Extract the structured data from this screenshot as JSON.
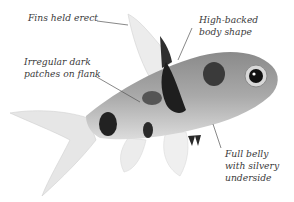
{
  "diagram": {
    "labels": [
      {
        "id": "fins",
        "lines": [
          "Fins held erect"
        ]
      },
      {
        "id": "high-backed",
        "lines": [
          "High-backed",
          "body shape"
        ]
      },
      {
        "id": "patches",
        "lines": [
          "Irregular dark",
          "patches on flank"
        ]
      },
      {
        "id": "belly",
        "lines": [
          "Full belly",
          "with silvery",
          "underside"
        ]
      }
    ]
  }
}
